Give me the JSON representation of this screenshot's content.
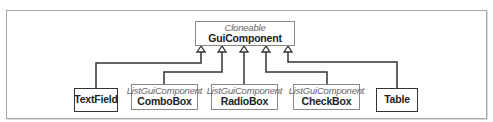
{
  "diagram": {
    "type": "uml-class-inheritance",
    "parent": {
      "stereotype": "Cloneable",
      "name": "GuiComponent"
    },
    "children": [
      {
        "name": "TextField",
        "stereotype": ""
      },
      {
        "name": "ComboBox",
        "stereotype": "ListGuiComponent"
      },
      {
        "name": "RadioBox",
        "stereotype": "ListGuiComponent"
      },
      {
        "name": "CheckBox",
        "stereotype": "ListGuiComponent"
      },
      {
        "name": "Table",
        "stereotype": ""
      }
    ],
    "colors": {
      "line": "#333333",
      "frame": "#a8a8a8",
      "stereotype_text": "#666666"
    }
  }
}
